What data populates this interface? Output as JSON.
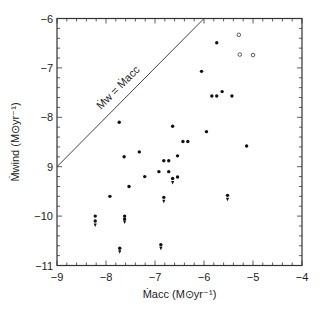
{
  "chart_data": {
    "type": "scatter",
    "title": "",
    "xlabel": "Ṁacc (M⊙yr⁻¹)",
    "ylabel": "Ṁwind (M⊙yr⁻¹)",
    "xlim": [
      -9,
      -4
    ],
    "ylim": [
      -11,
      -6
    ],
    "x_ticks": [
      -9,
      -8,
      -7,
      -6,
      -5,
      -4
    ],
    "x_tick_labels": [
      "−9",
      "−8",
      "−7",
      "−6",
      "−5",
      "−4"
    ],
    "y_ticks": [
      -6,
      -7,
      -8,
      -9,
      -10,
      -11
    ],
    "y_tick_labels": [
      "−6",
      "−7",
      "−8",
      "9",
      "−10",
      "−11"
    ],
    "minor_tick_step": 0.2,
    "grid": false,
    "legend": null,
    "annotations": [
      {
        "type": "line",
        "label": "Ṁw = Ṁacc",
        "from": [
          -9,
          -9
        ],
        "to": [
          -6,
          -6
        ]
      }
    ],
    "series": [
      {
        "name": "detections",
        "marker": "filled-circle",
        "points": [
          [
            -7.73,
            -8.1
          ],
          [
            -6.64,
            -8.18
          ],
          [
            -6.43,
            -8.49
          ],
          [
            -6.33,
            -8.49
          ],
          [
            -7.32,
            -8.7
          ],
          [
            -7.63,
            -8.8
          ],
          [
            -6.54,
            -8.78
          ],
          [
            -6.82,
            -8.88
          ],
          [
            -6.72,
            -8.88
          ],
          [
            -6.92,
            -9.1
          ],
          [
            -6.72,
            -9.1
          ],
          [
            -7.21,
            -9.2
          ],
          [
            -6.54,
            -9.21
          ],
          [
            -7.53,
            -9.4
          ],
          [
            -7.92,
            -9.6
          ],
          [
            -5.74,
            -6.49
          ],
          [
            -6.05,
            -7.07
          ],
          [
            -5.63,
            -7.48
          ],
          [
            -5.84,
            -7.57
          ],
          [
            -5.74,
            -7.57
          ],
          [
            -5.43,
            -7.57
          ],
          [
            -5.95,
            -8.29
          ],
          [
            -5.13,
            -8.58
          ]
        ]
      },
      {
        "name": "open-symbols",
        "marker": "open-circle",
        "points": [
          [
            -5.29,
            -6.33
          ],
          [
            -5.27,
            -6.73
          ],
          [
            -5.0,
            -6.74
          ]
        ]
      },
      {
        "name": "upper-limits",
        "marker": "filled-circle-with-down-arrow",
        "points": [
          [
            -8.22,
            -10.0
          ],
          [
            -8.22,
            -10.1
          ],
          [
            -7.62,
            -10.0
          ],
          [
            -7.62,
            -10.06
          ],
          [
            -7.72,
            -10.65
          ],
          [
            -6.88,
            -10.58
          ],
          [
            -6.64,
            -9.24
          ],
          [
            -6.82,
            -9.62
          ],
          [
            -5.52,
            -9.58
          ]
        ],
        "arrows": [
          [
            -8.22,
            -10.18
          ],
          [
            -7.62,
            -10.12
          ],
          [
            -7.72,
            -10.72
          ],
          [
            -6.88,
            -10.65
          ],
          [
            -6.64,
            -9.32
          ],
          [
            -6.82,
            -9.7
          ],
          [
            -5.52,
            -9.66
          ]
        ]
      }
    ]
  }
}
